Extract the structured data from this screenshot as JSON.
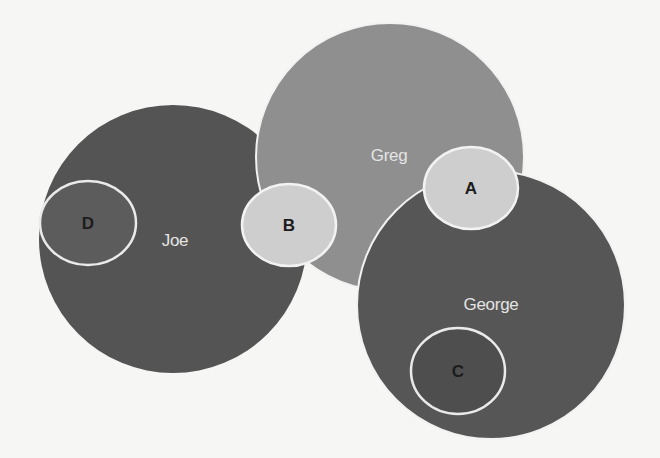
{
  "diagram": {
    "type": "overlapping-circles",
    "background": "#f6f6f4",
    "people": [
      {
        "id": "joe",
        "label": "Joe",
        "cx": 173,
        "cy": 239,
        "r": 134,
        "fill": "#545454",
        "stroke": "none",
        "label_x": 175,
        "label_y": 246
      },
      {
        "id": "greg",
        "label": "Greg",
        "cx": 390,
        "cy": 157,
        "r": 134,
        "fill": "#8f8f8f",
        "stroke": "#f2f2f2",
        "label_x": 389,
        "label_y": 161
      },
      {
        "id": "george",
        "label": "George",
        "cx": 491,
        "cy": 305,
        "r": 134,
        "fill": "#565656",
        "stroke": "#f2f2f2",
        "label_x": 491,
        "label_y": 310
      }
    ],
    "markers": [
      {
        "id": "a",
        "label": "A",
        "cx": 471,
        "cy": 188,
        "rx": 47,
        "ry": 41,
        "fill": "#cecece",
        "stroke": "#f2f2f2",
        "label_x": 471,
        "label_y": 194
      },
      {
        "id": "b",
        "label": "B",
        "cx": 289,
        "cy": 225,
        "rx": 47,
        "ry": 41,
        "fill": "#cecece",
        "stroke": "#f2f2f2",
        "label_x": 289,
        "label_y": 231
      },
      {
        "id": "c",
        "label": "C",
        "cx": 458,
        "cy": 371,
        "rx": 47,
        "ry": 43,
        "fill": "#4e4e4e",
        "stroke": "#eaeaea",
        "label_x": 458,
        "label_y": 377
      },
      {
        "id": "d",
        "label": "D",
        "cx": 88,
        "cy": 223,
        "rx": 48,
        "ry": 42,
        "fill": "#5c5c5c",
        "stroke": "#eaeaea",
        "label_x": 88,
        "label_y": 229
      }
    ]
  }
}
